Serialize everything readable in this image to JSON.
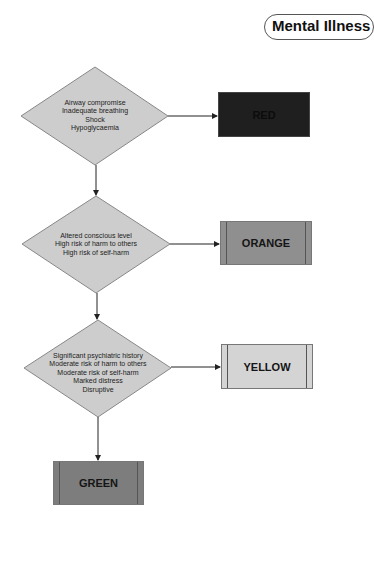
{
  "title": "Mental Illness",
  "colors": {
    "diamond_fill": "#cdcdcd",
    "diamond_stroke": "#888888",
    "red_box": "#1f1f1f",
    "orange_box": "#8f8f8f",
    "yellow_box": "#d4d4d4",
    "green_box": "#7d7d7d",
    "arrow": "#222222"
  },
  "decisions": [
    {
      "lines": [
        "Airway compromise",
        "Inadequate breathing",
        "Shock",
        "Hypoglycaemia"
      ]
    },
    {
      "lines": [
        "Altered conscious level",
        "High risk of harm to others",
        "High risk of self-harm"
      ]
    },
    {
      "lines": [
        "Significant psychiatric history",
        "Moderate risk of harm to others",
        "Moderate risk of self-harm",
        "Marked distress",
        "Disruptive"
      ]
    }
  ],
  "outcomes": {
    "red": "RED",
    "orange": "ORANGE",
    "yellow": "YELLOW",
    "green": "GREEN"
  }
}
